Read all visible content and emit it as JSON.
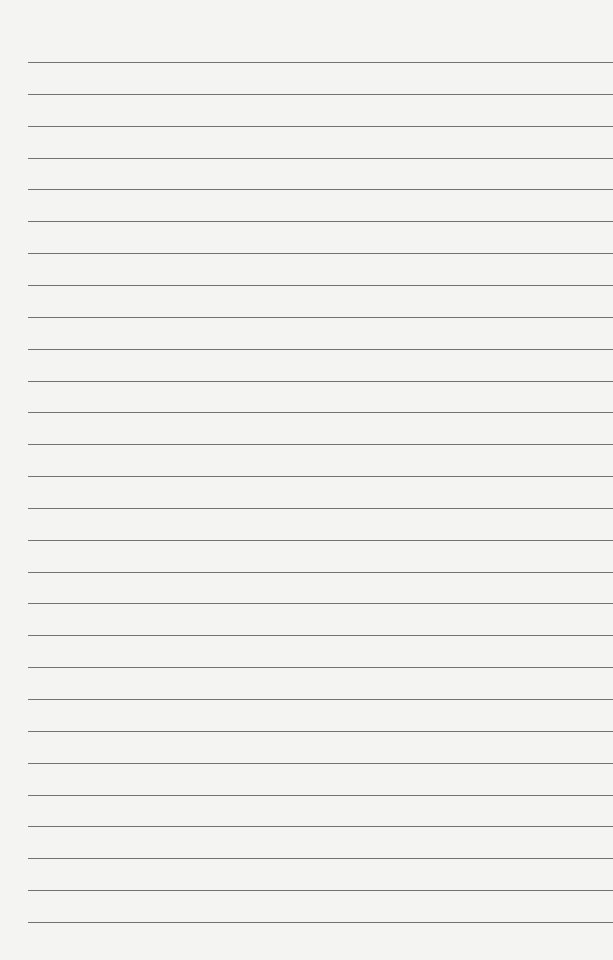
{
  "page": {
    "type": "lined-paper",
    "background_color": "#f4f4f3",
    "line_color": "#5a5a5a",
    "line_count": 28,
    "first_line_y": 62,
    "line_spacing": 31.85,
    "line_left_x": 28,
    "line_right_x": 613,
    "lines": []
  }
}
